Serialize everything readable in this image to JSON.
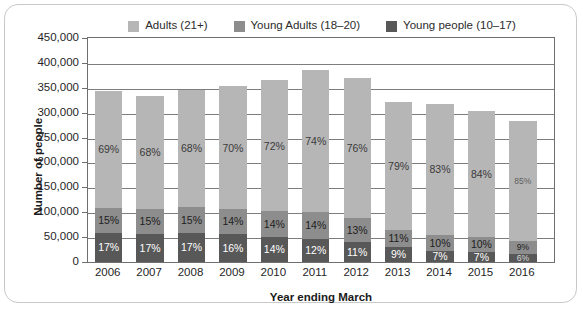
{
  "chart_data": {
    "type": "bar",
    "subtype": "stacked-bar",
    "title": "",
    "xlabel": "Year ending March",
    "ylabel": "Number of people",
    "ylim": [
      0,
      450000
    ],
    "ytick_labels": [
      "450,000",
      "400,000",
      "350,000",
      "300,000",
      "250,000",
      "200,000",
      "150,000",
      "100,000",
      "50,000",
      "0"
    ],
    "ytick_values": [
      450000,
      400000,
      350000,
      300000,
      250000,
      200000,
      150000,
      100000,
      50000,
      0
    ],
    "grid": true,
    "legend_position": "top",
    "categories": [
      "2006",
      "2007",
      "2008",
      "2009",
      "2010",
      "2011",
      "2012",
      "2013",
      "2014",
      "2015",
      "2016"
    ],
    "series": [
      {
        "name": "Adults (21+)",
        "color": "#b6b6b6",
        "percent_labels": [
          "69%",
          "68%",
          "68%",
          "70%",
          "72%",
          "74%",
          "76%",
          "79%",
          "83%",
          "84%",
          "85%"
        ],
        "percents": [
          69,
          68,
          68,
          70,
          72,
          74,
          76,
          79,
          83,
          84,
          85
        ],
        "values": [
          236670,
          226440,
          234600,
          247100,
          262800,
          284900,
          280440,
          253590,
          263110,
          254520,
          240550
        ]
      },
      {
        "name": "Young Adults (18–20)",
        "color": "#8d8d8d",
        "percent_labels": [
          "15%",
          "15%",
          "15%",
          "14%",
          "14%",
          "14%",
          "13%",
          "11%",
          "10%",
          "10%",
          "9%"
        ],
        "percents": [
          15,
          15,
          15,
          14,
          14,
          14,
          13,
          11,
          10,
          10,
          9
        ],
        "values": [
          51450,
          49950,
          51750,
          49420,
          51100,
          53900,
          48010,
          35310,
          31700,
          30300,
          25470
        ]
      },
      {
        "name": "Young people (10–17)",
        "color": "#585858",
        "percent_labels": [
          "17%",
          "17%",
          "17%",
          "16%",
          "14%",
          "12%",
          "11%",
          "9%",
          "7%",
          "7%",
          "6%"
        ],
        "percents": [
          17,
          17,
          17,
          16,
          14,
          12,
          11,
          9,
          7,
          7,
          6
        ],
        "values": [
          58310,
          56610,
          58650,
          56480,
          51100,
          46200,
          40590,
          28890,
          22190,
          21210,
          16980
        ]
      }
    ],
    "totals": [
      343000,
      333000,
      345000,
      353000,
      365000,
      385000,
      369000,
      321000,
      317000,
      303000,
      283000
    ]
  },
  "legend": {
    "items": [
      {
        "label": "Adults (21+)",
        "color": "#b6b6b6"
      },
      {
        "label": "Young Adults (18–20)",
        "color": "#8d8d8d"
      },
      {
        "label": "Young people (10–17)",
        "color": "#585858"
      }
    ]
  },
  "axes": {
    "y_title": "Number of people",
    "x_title": "Year ending March"
  }
}
